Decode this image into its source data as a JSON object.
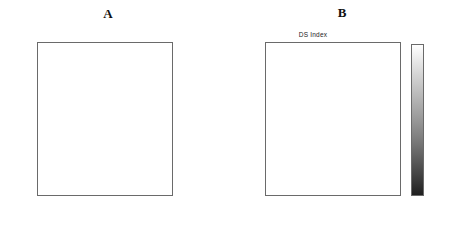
{
  "figure": {
    "background": "#ffffff",
    "width": 452,
    "height": 229
  },
  "panel_a": {
    "title": "A",
    "legend_name": "direction-arrow-legend",
    "arrow_directions_deg": [
      180,
      45,
      270,
      315,
      180,
      45,
      90,
      315,
      180
    ],
    "arrow_count": 9
  },
  "panel_b": {
    "title": "B",
    "subtitle": "DS Index"
  },
  "axes": {
    "x_ticks": [
      "10",
      "20",
      "30",
      "40",
      "50",
      "60"
    ],
    "y_ticks": [
      "10",
      "20",
      "30",
      "40",
      "50",
      "60"
    ],
    "x_tick_values": [
      10,
      20,
      30,
      40,
      50,
      60
    ],
    "y_tick_values": [
      10,
      20,
      30,
      40,
      50,
      60
    ]
  },
  "colorbar": {
    "ticks": [
      "0.9",
      "0.8",
      "0.7",
      "0.6",
      "0.5",
      "0.4"
    ],
    "tick_values": [
      0.9,
      0.8,
      0.7,
      0.6,
      0.5,
      0.4
    ],
    "min": 0.4,
    "max": 0.95,
    "colormap": "grayscale",
    "low_color": "#1f1f1f",
    "high_color": "#ffffff"
  },
  "chart_data": [
    {
      "type": "heatmap",
      "name": "direction-preference-map",
      "title": "A",
      "xlabel": "",
      "ylabel": "",
      "grid": false,
      "legend_position": "right",
      "nx": 60,
      "ny": 60,
      "xlim": [
        1,
        60
      ],
      "ylim": [
        60,
        1
      ],
      "x_ticks": [
        10,
        20,
        30,
        40,
        50,
        60
      ],
      "y_ticks": [
        10,
        20,
        30,
        40,
        50,
        60
      ],
      "colormap": "grayscale-discrete",
      "value_levels": [
        0.12,
        0.3,
        0.46,
        0.62,
        0.78,
        0.92
      ],
      "description": "Quantized preferred-direction map over a 60x60 cortical grid; legend at right shows 9 arrow marks cycling through a full rotation of direction.",
      "annotations": [
        {
          "text": "A",
          "position": "top-center"
        }
      ]
    },
    {
      "type": "heatmap",
      "name": "ds-index-map",
      "title": "B",
      "subtitle": "DS Index",
      "xlabel": "",
      "ylabel": "",
      "grid": false,
      "legend_position": "right-colorbar",
      "nx": 60,
      "ny": 60,
      "xlim": [
        1,
        60
      ],
      "ylim": [
        60,
        1
      ],
      "x_ticks": [
        10,
        20,
        30,
        40,
        50,
        60
      ],
      "y_ticks": [
        10,
        20,
        30,
        40,
        50,
        60
      ],
      "colormap": "grayscale",
      "zlim": [
        0.4,
        0.95
      ],
      "colorbar_ticks": [
        0.4,
        0.5,
        0.6,
        0.7,
        0.8,
        0.9
      ],
      "description": "Continuous direction-selectivity index map over the same 60x60 grid; bright regions indicate high DS index, dark pixels indicate low DS index.",
      "annotations": [
        {
          "text": "B",
          "position": "top-center"
        },
        {
          "text": "DS Index",
          "position": "above-axes"
        }
      ]
    }
  ]
}
